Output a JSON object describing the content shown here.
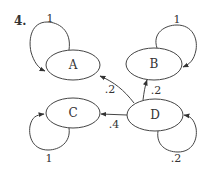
{
  "problem": {
    "number_label": "4."
  },
  "colors": {
    "stroke": "#444444",
    "text": "#333333",
    "background": "#ffffff"
  },
  "nodes": [
    {
      "id": "A",
      "label": "A",
      "cx": 73,
      "cy": 65,
      "rx": 27,
      "ry": 15
    },
    {
      "id": "B",
      "label": "B",
      "cx": 154,
      "cy": 64,
      "rx": 28,
      "ry": 16
    },
    {
      "id": "C",
      "label": "C",
      "cx": 73,
      "cy": 113,
      "rx": 27,
      "ry": 15
    },
    {
      "id": "D",
      "label": "D",
      "cx": 155,
      "cy": 115,
      "rx": 28,
      "ry": 16
    }
  ],
  "edges": [
    {
      "from": "A",
      "to": "A",
      "label": "1"
    },
    {
      "from": "B",
      "to": "B",
      "label": "1"
    },
    {
      "from": "C",
      "to": "C",
      "label": "1"
    },
    {
      "from": "D",
      "to": "D",
      "label": ".2"
    },
    {
      "from": "D",
      "to": "A",
      "label": ".2"
    },
    {
      "from": "D",
      "to": "B",
      "label": ".2"
    },
    {
      "from": "D",
      "to": "C",
      "label": ".4"
    }
  ]
}
